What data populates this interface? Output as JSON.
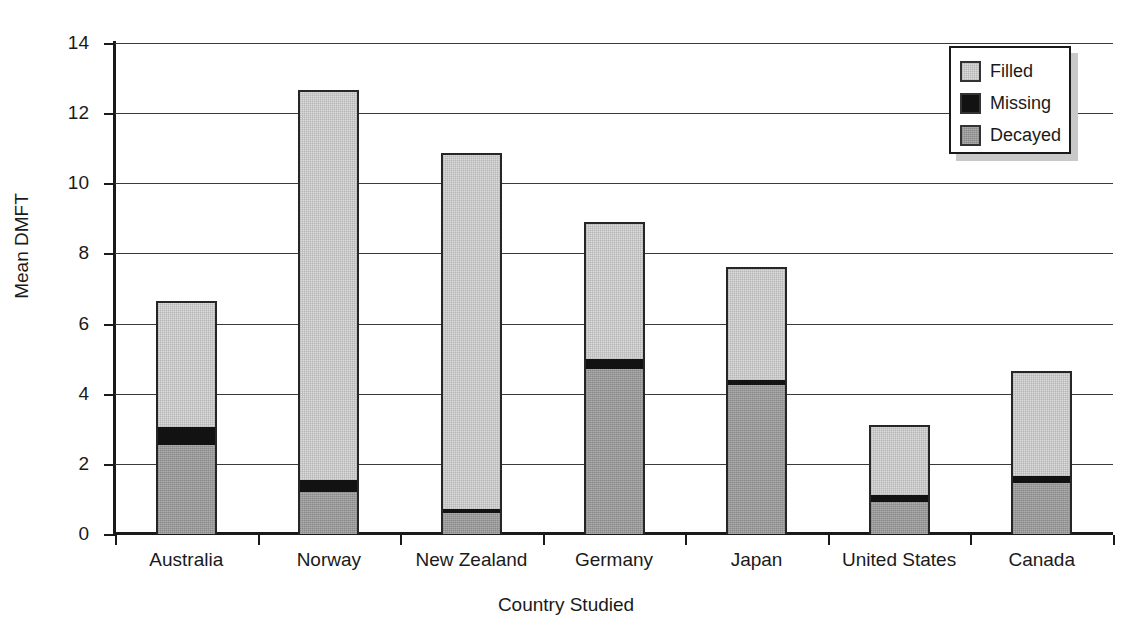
{
  "chart_data": {
    "type": "bar",
    "subtype": "stacked-vertical",
    "title": "",
    "xlabel": "Country Studied",
    "ylabel": "Mean DMFT",
    "ylim": [
      0,
      14
    ],
    "ytick_step": 2,
    "yticks": [
      "0",
      "2",
      "4",
      "6",
      "8",
      "10",
      "12",
      "14"
    ],
    "grid": "horizontal",
    "legend_position": "top-right",
    "categories": [
      "Australia",
      "Norway",
      "New Zealand",
      "Germany",
      "Japan",
      "United States",
      "Canada"
    ],
    "series": [
      {
        "name": "Decayed",
        "color": "#9a9a9a",
        "values": [
          2.55,
          1.2,
          0.6,
          4.7,
          4.25,
          0.9,
          1.45
        ]
      },
      {
        "name": "Missing",
        "color": "#121212",
        "values": [
          0.5,
          0.35,
          0.1,
          0.3,
          0.15,
          0.2,
          0.2
        ]
      },
      {
        "name": "Filled",
        "color": "#dcdcdc",
        "values": [
          3.6,
          11.1,
          10.15,
          3.9,
          3.2,
          2.0,
          3.0
        ]
      }
    ],
    "stack_order_bottom_to_top": [
      "Decayed",
      "Missing",
      "Filled"
    ],
    "totals": [
      6.65,
      12.65,
      10.85,
      8.9,
      7.6,
      3.1,
      4.65
    ]
  },
  "legend": {
    "items": [
      {
        "label": "Filled",
        "swatch": "filled-swatch"
      },
      {
        "label": "Missing",
        "swatch": "missing-swatch"
      },
      {
        "label": "Decayed",
        "swatch": "decayed-swatch"
      }
    ]
  },
  "axes": {
    "y_title": "Mean DMFT",
    "x_title": "Country Studied"
  }
}
